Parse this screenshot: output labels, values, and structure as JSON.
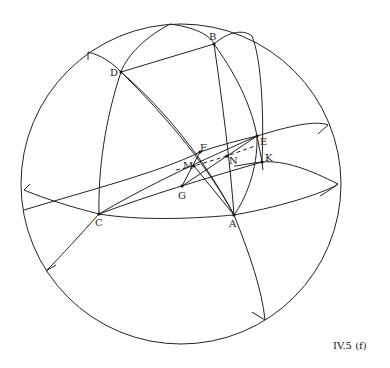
{
  "figure": {
    "caption": "IV.5 (f)"
  },
  "points": {
    "A": {
      "label": "A",
      "x": 234,
      "y": 215
    },
    "B": {
      "label": "B",
      "x": 214,
      "y": 44
    },
    "C": {
      "label": "C",
      "x": 99,
      "y": 214
    },
    "D": {
      "label": "D",
      "x": 121,
      "y": 72
    },
    "E": {
      "label": "E",
      "x": 257,
      "y": 136
    },
    "F": {
      "label": "F",
      "x": 200,
      "y": 152
    },
    "G": {
      "label": "G",
      "x": 182,
      "y": 186
    },
    "K": {
      "label": "K",
      "x": 262,
      "y": 162
    },
    "M": {
      "label": "M",
      "x": 194,
      "y": 166
    },
    "N": {
      "label": "N",
      "x": 227,
      "y": 156
    }
  },
  "labels": {
    "A": "A",
    "B": "B",
    "C": "C",
    "D": "D",
    "E": "E",
    "F": "F",
    "G": "G",
    "K": "K",
    "M": "M",
    "N": "N"
  },
  "colors": {
    "stroke": "#222222",
    "background": "#ffffff"
  }
}
